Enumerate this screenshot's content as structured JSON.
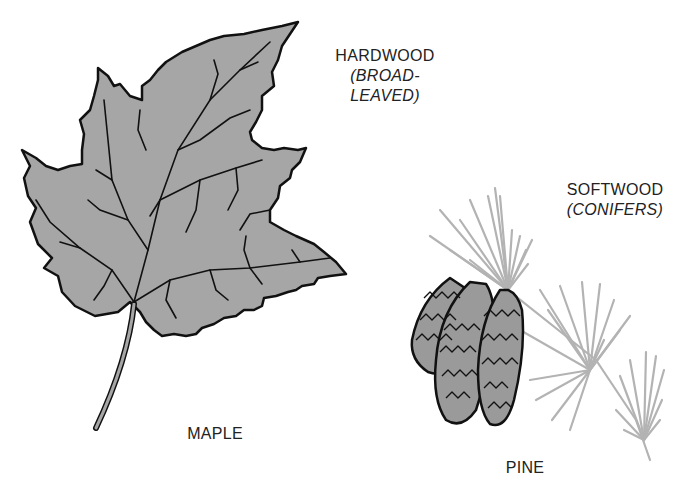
{
  "hardwood": {
    "title": "HARDWOOD",
    "subtitle": "(BROAD-LEAVED)",
    "specimen": "MAPLE",
    "colors": {
      "fill": "#a6a6a6",
      "outline": "#111111"
    }
  },
  "softwood": {
    "title": "SOFTWOOD",
    "subtitle": "(CONIFERS)",
    "specimen": "PINE",
    "colors": {
      "needles": "#b3b3b3",
      "cone_fill": "#9a9a9a",
      "cone_outline": "#111111"
    }
  }
}
